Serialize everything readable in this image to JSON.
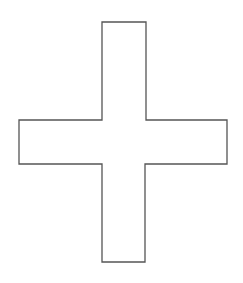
{
  "diagram": {
    "shape": "cross",
    "fill": "#ffffff",
    "stroke": "#555555",
    "stroke_width": 1.3,
    "points": "102,22 146,22 146,120 227,120 227,164 145,164 145,262 102,262 102,164 19,164 19,120 102,120"
  }
}
